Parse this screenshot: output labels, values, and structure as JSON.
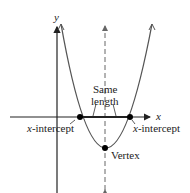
{
  "diagram": {
    "axes": {
      "x_label": "x",
      "y_label": "y"
    },
    "annotations": {
      "same_length_line1": "Same",
      "same_length_line2": "length",
      "left_intercept_var": "x",
      "left_intercept_text": "-intercept",
      "right_intercept_var": "x",
      "right_intercept_text": "-intercept",
      "vertex": "Vertex"
    },
    "points": [
      {
        "name": "left-x-intercept",
        "px": [
          80,
          117
        ]
      },
      {
        "name": "right-x-intercept",
        "px": [
          130,
          117
        ]
      },
      {
        "name": "vertex",
        "px": [
          105,
          148
        ]
      }
    ],
    "colors": {
      "curve": "#555555",
      "axis": "#222222",
      "point": "#000000"
    }
  }
}
